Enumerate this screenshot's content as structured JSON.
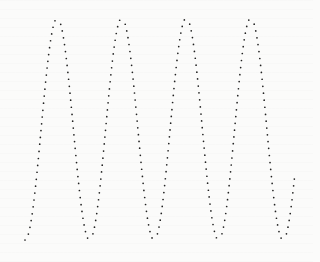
{
  "chart_data": {
    "type": "scatter",
    "title": "",
    "xlabel": "",
    "ylabel": "",
    "grid": false,
    "legend": null,
    "series": [
      {
        "name": "sine",
        "color": "#222222",
        "marker": "dot",
        "pixel_params": {
          "x_start": 25,
          "x_end": 295,
          "period_px": 64.5,
          "center_y": 129,
          "amplitude_px": 111,
          "phase": "trough_at_start",
          "point_spacing_px": 2.6
        },
        "peaks_x": [
          58,
          122,
          185,
          249
        ],
        "troughs_x": [
          25,
          90,
          154,
          218,
          283
        ],
        "peak_y_px": 18,
        "trough_y_px": 240
      }
    ],
    "xlim": [
      0,
      4.2
    ],
    "ylim": [
      -1,
      1
    ]
  }
}
